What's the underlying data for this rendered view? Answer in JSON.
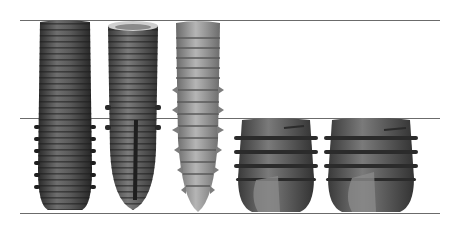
{
  "figure": {
    "reference_lines": [
      {
        "name": "top-line",
        "y": 20
      },
      {
        "name": "middle-line",
        "y": 118
      },
      {
        "name": "bottom-line",
        "y": 213
      }
    ],
    "line_color": "#6b6b6b",
    "implants": [
      {
        "name": "implant-1",
        "shape": "long parallel-walled threaded",
        "label": ""
      },
      {
        "name": "implant-2",
        "shape": "long tapered with collar and apical slots",
        "label": ""
      },
      {
        "name": "implant-3",
        "shape": "long tapered aggressive threads",
        "label": ""
      },
      {
        "name": "implant-4",
        "shape": "short wide threaded",
        "label": ""
      },
      {
        "name": "implant-5",
        "shape": "short extra-wide threaded",
        "label": ""
      }
    ]
  }
}
